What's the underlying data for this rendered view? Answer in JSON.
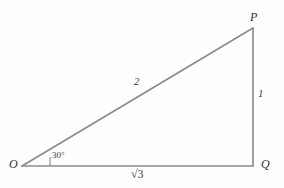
{
  "figure": {
    "type": "right-triangle-30-60-90",
    "background_color": "#fefefe",
    "stroke_color": "#8a8a8a",
    "text_color": "#3c3c3c"
  },
  "vertices": [
    {
      "name": "O",
      "label": "O",
      "x": 22,
      "y": 166
    },
    {
      "name": "P",
      "label": "P",
      "x": 253,
      "y": 28
    },
    {
      "name": "Q",
      "label": "Q",
      "x": 253,
      "y": 166
    }
  ],
  "sides": [
    {
      "name": "hypotenuse-OP",
      "label": "2"
    },
    {
      "name": "vertical-PQ",
      "label": "1"
    },
    {
      "name": "base-OQ",
      "label": "√3",
      "radicand": "3"
    }
  ],
  "angles": [
    {
      "name": "angle-at-O",
      "label": "30°",
      "value": 30,
      "unit": "degrees"
    }
  ]
}
